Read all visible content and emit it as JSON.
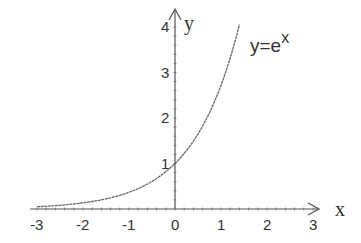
{
  "chart_data": {
    "type": "line",
    "title": "",
    "xlabel": "x",
    "ylabel": "y",
    "xlim": [
      -3,
      3
    ],
    "ylim": [
      0,
      4
    ],
    "grid": false,
    "legend": null,
    "x_ticks": [
      "-3",
      "-2",
      "-1",
      "0",
      "1",
      "2",
      "3"
    ],
    "y_ticks": [
      "1",
      "2",
      "3",
      "4"
    ],
    "series": [
      {
        "name": "y=e^x",
        "function": "exp(x)",
        "x": [
          -3,
          -2.5,
          -2,
          -1.5,
          -1,
          -0.5,
          0,
          0.25,
          0.5,
          0.75,
          1,
          1.2,
          1.4
        ],
        "values": [
          0.05,
          0.08,
          0.14,
          0.22,
          0.37,
          0.61,
          1.0,
          1.28,
          1.65,
          2.12,
          2.72,
          3.32,
          4.06
        ]
      }
    ],
    "annotations": [
      {
        "text": "y=e",
        "superscript": "x",
        "position": "upper right of curve"
      }
    ],
    "colors": {
      "axis": "#555555",
      "curve": "#666666",
      "text": "#333333"
    }
  }
}
